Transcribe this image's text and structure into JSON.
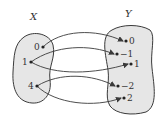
{
  "colors": {
    "background": "#ffffff",
    "blob_fill": "#e6e6e6",
    "stroke": "#3a3a3a"
  },
  "sets": {
    "X": {
      "label": "X",
      "elements": [
        "0",
        "1",
        "4"
      ]
    },
    "Y": {
      "label": "Y",
      "elements": [
        "0",
        "−1",
        "1",
        "−2",
        "2"
      ]
    }
  },
  "mappings": [
    {
      "from": "0",
      "to": "0"
    },
    {
      "from": "1",
      "to": "−1"
    },
    {
      "from": "1",
      "to": "1"
    },
    {
      "from": "4",
      "to": "−2"
    },
    {
      "from": "4",
      "to": "2"
    }
  ]
}
